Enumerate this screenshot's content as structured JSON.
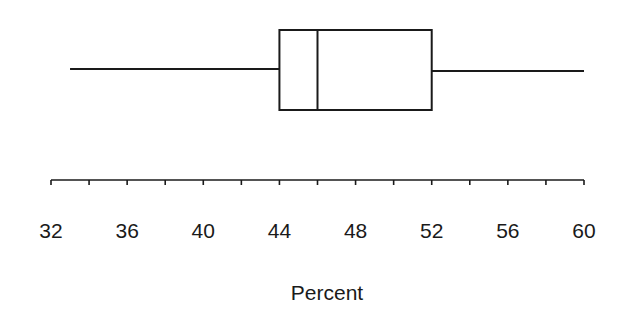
{
  "chart_data": {
    "type": "boxplot",
    "title": "",
    "xlabel": "Percent",
    "ylabel": "",
    "orientation": "horizontal",
    "xlim": [
      32,
      60
    ],
    "grid": false,
    "legend": null,
    "major_ticks": [
      32,
      36,
      40,
      44,
      48,
      52,
      56,
      60
    ],
    "minor_tick_step": 2,
    "tick_labels": [
      "32",
      "36",
      "40",
      "44",
      "48",
      "52",
      "56",
      "60"
    ],
    "box": {
      "min": 33,
      "q1": 44,
      "median": 46,
      "q3": 52,
      "max": 60
    }
  }
}
